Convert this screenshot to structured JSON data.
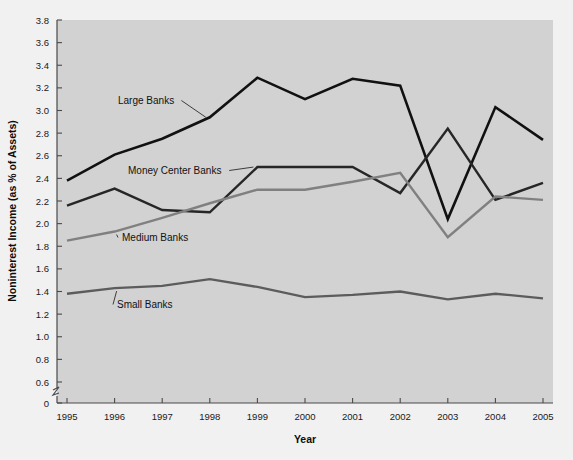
{
  "figure": {
    "background_color": "#f1f1f1",
    "plot_background_color": "#d2d2d2"
  },
  "chart_data": {
    "type": "line",
    "title": "",
    "xlabel": "Year",
    "ylabel": "Noninterest Income (as % of Assets)",
    "categories": [
      "1995",
      "1996",
      "1997",
      "1998",
      "1999",
      "2000",
      "2001",
      "2002",
      "2003",
      "2004",
      "2005"
    ],
    "x": [
      1995,
      1996,
      1997,
      1998,
      1999,
      2000,
      2001,
      2002,
      2003,
      2004,
      2005
    ],
    "xlim": [
      1995,
      2005
    ],
    "ylim": [
      0,
      3.8
    ],
    "y_axis_break": true,
    "y_break_between": [
      0,
      0.6
    ],
    "yticks": [
      0,
      0.6,
      0.8,
      1.0,
      1.2,
      1.4,
      1.6,
      1.8,
      2.0,
      2.2,
      2.4,
      2.6,
      2.8,
      3.0,
      3.2,
      3.4,
      3.6,
      3.8
    ],
    "ytick_labels": [
      "0",
      "0.6",
      "0.8",
      "1.0",
      "1.2",
      "1.4",
      "1.6",
      "1.8",
      "2.0",
      "2.2",
      "2.4",
      "2.6",
      "2.8",
      "3.0",
      "3.2",
      "3.4",
      "3.6",
      "3.8"
    ],
    "grid": false,
    "legend_position": "inline-annotations",
    "series": [
      {
        "name": "Large Banks",
        "color": "#111111",
        "width": 2.6,
        "values": [
          2.38,
          2.61,
          2.75,
          2.94,
          3.29,
          3.1,
          3.28,
          3.22,
          2.04,
          3.03,
          2.74
        ]
      },
      {
        "name": "Money Center Banks",
        "color": "#262626",
        "width": 2.4,
        "values": [
          2.16,
          2.31,
          2.12,
          2.1,
          2.5,
          2.5,
          2.5,
          2.27,
          2.84,
          2.21,
          2.36
        ]
      },
      {
        "name": "Medium Banks",
        "color": "#808080",
        "width": 2.4,
        "values": [
          1.85,
          1.93,
          2.05,
          2.18,
          2.3,
          2.3,
          2.37,
          2.45,
          1.88,
          2.24,
          2.21
        ]
      },
      {
        "name": "Small Banks",
        "color": "#5c5c5c",
        "width": 2.3,
        "values": [
          1.38,
          1.43,
          1.45,
          1.51,
          1.44,
          1.35,
          1.37,
          1.4,
          1.33,
          1.38,
          1.34
        ]
      }
    ],
    "annotations": [
      {
        "text": "Large Banks",
        "target_year": 1998,
        "anchor_x": 118,
        "anchor_y": 104
      },
      {
        "text": "Money Center Banks",
        "target_year": 1999,
        "anchor_x": 128,
        "anchor_y": 174
      },
      {
        "text": "Medium Banks",
        "target_year": 1996,
        "anchor_x": 122,
        "anchor_y": 241
      },
      {
        "text": "Small Banks",
        "target_year": 1996,
        "anchor_x": 117,
        "anchor_y": 308
      }
    ]
  }
}
